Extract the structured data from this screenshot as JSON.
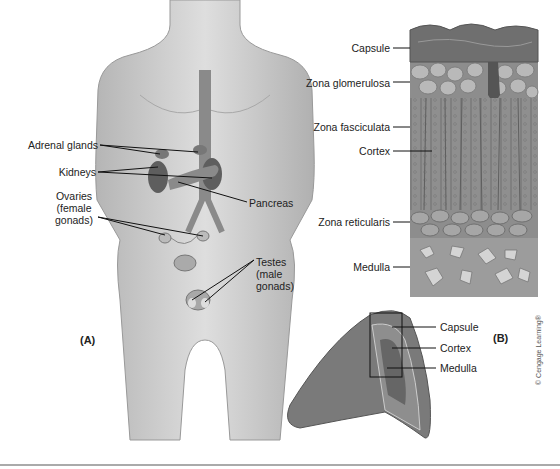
{
  "figure": {
    "panel_a": {
      "label": "(A)",
      "labels": {
        "adrenal_glands": "Adrenal glands",
        "kidneys": "Kidneys",
        "ovaries_1": "Ovaries",
        "ovaries_2": "(female",
        "ovaries_3": "gonads)",
        "pancreas": "Pancreas",
        "testes_1": "Testes",
        "testes_2": "(male",
        "testes_3": "gonads)"
      }
    },
    "panel_b": {
      "label": "(B)",
      "section_labels": {
        "capsule": "Capsule",
        "zona_glomerulosa": "Zona glomerulosa",
        "zona_fasciculata": "Zona fasciculata",
        "cortex": "Cortex",
        "zona_reticularis": "Zona reticularis",
        "medulla": "Medulla"
      },
      "gland_labels": {
        "capsule": "Capsule",
        "cortex": "Cortex",
        "medulla": "Medulla"
      }
    },
    "credit": "© Cengage Learning®",
    "colors": {
      "body": "#c9c9c9",
      "organ": "#6e6e6e",
      "tissue": "#8a8a8a",
      "leader": "#111111"
    }
  }
}
